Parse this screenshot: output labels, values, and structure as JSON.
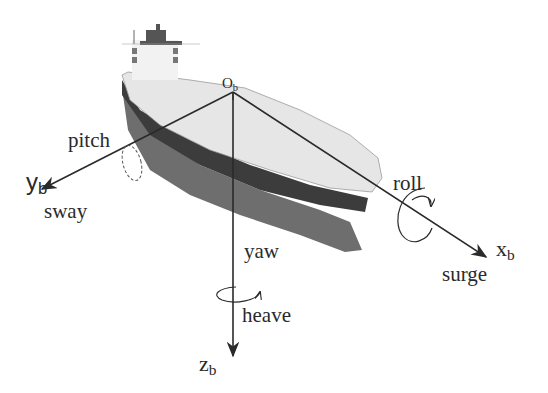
{
  "diagram": {
    "origin": {
      "label": "O",
      "sub": "b"
    },
    "axes": [
      {
        "id": "x",
        "label": "x",
        "sub": "b",
        "motion": "surge",
        "rotation": "roll"
      },
      {
        "id": "y",
        "label": "y",
        "sub": "b",
        "motion": "sway",
        "rotation": "pitch"
      },
      {
        "id": "z",
        "label": "z",
        "sub": "b",
        "motion": "heave",
        "rotation": "yaw"
      }
    ]
  },
  "colors": {
    "axis": "#2a2a2a",
    "deck": "#e6e6e6",
    "hull_dark": "#3c3c3c",
    "hull_mid": "#6e6e6e",
    "superstructure": "#f2f2f2"
  }
}
